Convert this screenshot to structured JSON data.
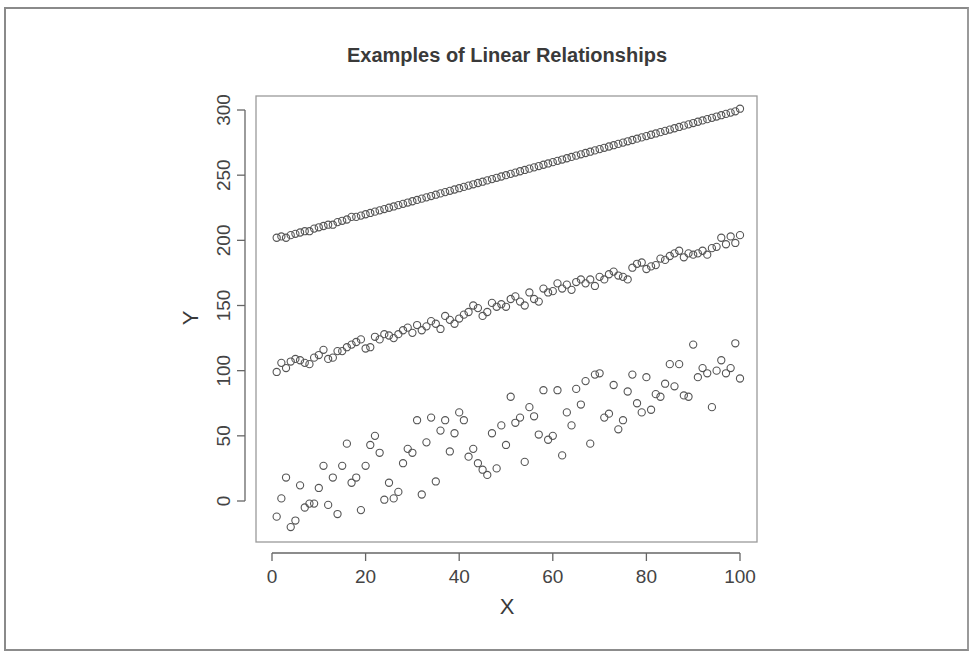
{
  "chart_data": {
    "type": "scatter",
    "title": "Examples of Linear Relationships",
    "xlabel": "X",
    "ylabel": "Y",
    "xlim": [
      0,
      100
    ],
    "ylim": [
      -30,
      310
    ],
    "x_ticks": [
      0,
      20,
      40,
      60,
      80,
      100
    ],
    "y_ticks": [
      0,
      50,
      100,
      150,
      200,
      250,
      300
    ],
    "grid": false,
    "legend": null,
    "marker": "open-circle",
    "x": [
      1,
      2,
      3,
      4,
      5,
      6,
      7,
      8,
      9,
      10,
      11,
      12,
      13,
      14,
      15,
      16,
      17,
      18,
      19,
      20,
      21,
      22,
      23,
      24,
      25,
      26,
      27,
      28,
      29,
      30,
      31,
      32,
      33,
      34,
      35,
      36,
      37,
      38,
      39,
      40,
      41,
      42,
      43,
      44,
      45,
      46,
      47,
      48,
      49,
      50,
      51,
      52,
      53,
      54,
      55,
      56,
      57,
      58,
      59,
      60,
      61,
      62,
      63,
      64,
      65,
      66,
      67,
      68,
      69,
      70,
      71,
      72,
      73,
      74,
      75,
      76,
      77,
      78,
      79,
      80,
      81,
      82,
      83,
      84,
      85,
      86,
      87,
      88,
      89,
      90,
      91,
      92,
      93,
      94,
      95,
      96,
      97,
      98,
      99,
      100
    ],
    "series": [
      {
        "name": "strong (y = 200 + x, low noise)",
        "values": [
          202,
          203,
          202,
          204,
          205,
          206,
          207,
          207,
          209,
          210,
          211,
          212,
          212,
          214,
          215,
          216,
          218,
          218,
          219,
          220,
          221,
          222,
          223,
          224,
          225,
          226,
          227,
          228,
          229,
          230,
          231,
          232,
          233,
          234,
          235,
          236,
          237,
          238,
          239,
          240,
          241,
          242,
          243,
          244,
          245,
          246,
          247,
          248,
          249,
          250,
          251,
          252,
          253,
          254,
          255,
          256,
          257,
          258,
          259,
          260,
          261,
          262,
          263,
          264,
          265,
          266,
          267,
          268,
          269,
          270,
          271,
          272,
          273,
          274,
          275,
          276,
          277,
          278,
          279,
          280,
          281,
          282,
          283,
          284,
          285,
          286,
          287,
          288,
          289,
          290,
          291,
          292,
          293,
          294,
          295,
          296,
          297,
          298,
          299,
          301
        ]
      },
      {
        "name": "moderate (y = 100 + x, medium noise)",
        "values": [
          99,
          106,
          102,
          107,
          109,
          108,
          106,
          105,
          110,
          112,
          116,
          109,
          110,
          115,
          115,
          118,
          120,
          122,
          124,
          117,
          118,
          126,
          124,
          128,
          127,
          125,
          128,
          131,
          133,
          129,
          135,
          131,
          134,
          138,
          136,
          132,
          142,
          139,
          136,
          140,
          143,
          145,
          150,
          148,
          142,
          145,
          152,
          149,
          151,
          149,
          155,
          157,
          153,
          150,
          160,
          155,
          153,
          163,
          160,
          161,
          167,
          163,
          166,
          162,
          168,
          170,
          167,
          170,
          165,
          172,
          170,
          174,
          176,
          173,
          172,
          170,
          179,
          182,
          183,
          178,
          180,
          181,
          186,
          185,
          188,
          190,
          192,
          187,
          190,
          189,
          190,
          192,
          189,
          194,
          195,
          202,
          197,
          203,
          198,
          204
        ]
      },
      {
        "name": "weak (y = x, high noise)",
        "values": [
          -12,
          2,
          18,
          -20,
          -15,
          12,
          -5,
          -2,
          -2,
          10,
          27,
          -3,
          18,
          -10,
          27,
          44,
          14,
          18,
          -7,
          27,
          43,
          50,
          37,
          1,
          14,
          2,
          7,
          29,
          40,
          37,
          62,
          5,
          45,
          64,
          15,
          54,
          62,
          38,
          52,
          68,
          62,
          34,
          40,
          29,
          24,
          20,
          52,
          25,
          58,
          43,
          80,
          60,
          64,
          30,
          72,
          65,
          51,
          85,
          47,
          50,
          85,
          35,
          68,
          58,
          86,
          74,
          92,
          44,
          97,
          98,
          64,
          67,
          89,
          55,
          62,
          84,
          97,
          75,
          68,
          95,
          70,
          82,
          80,
          90,
          105,
          88,
          105,
          81,
          80,
          120,
          95,
          102,
          98,
          72,
          100,
          108,
          98,
          102,
          121,
          94
        ]
      }
    ]
  },
  "chart": {
    "title": "Examples of Linear Relationships",
    "xlabel": "X",
    "ylabel": "Y",
    "x_tick_labels": [
      "0",
      "20",
      "40",
      "60",
      "80",
      "100"
    ],
    "y_tick_labels": [
      "0",
      "50",
      "100",
      "150",
      "200",
      "250",
      "300"
    ]
  },
  "colors": {
    "marker": "#555555",
    "axis": "#666666",
    "text": "#3a3a3a",
    "frame": "#8a8a8a"
  }
}
